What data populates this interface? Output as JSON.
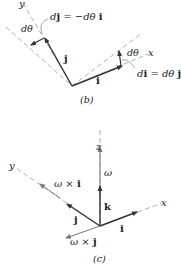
{
  "panel_b": {
    "caption": "(b)",
    "axis_y_label": "y",
    "axis_x_label": "x",
    "vector_j_label": "j",
    "vector_i_label": "i",
    "angle_label_left": "dθ",
    "angle_label_right": "dθ",
    "dj_eq": {
      "lhs_d": "d",
      "lhs_v": "j",
      "eq": " = −dθ ",
      "rhs_v": "i"
    },
    "di_eq": {
      "lhs_d": "d",
      "lhs_v": "i",
      "eq": " = dθ ",
      "rhs_v": "j"
    }
  },
  "panel_c": {
    "caption": "(c)",
    "axis_z_label": "z",
    "axis_y_label": "y",
    "axis_x_label": "x",
    "omega_label": "ω",
    "vector_k_label": "k",
    "vector_j_label": "j",
    "vector_i_label": "i",
    "omega_x_i": {
      "w": "ω",
      "x": " × ",
      "v": "i"
    },
    "omega_x_j": {
      "w": "ω",
      "x": " × ",
      "v": "j"
    }
  },
  "colors": {
    "ink": "#222222",
    "dashed": "#9a9a9a",
    "vector": "#333333",
    "leader": "#888888"
  }
}
